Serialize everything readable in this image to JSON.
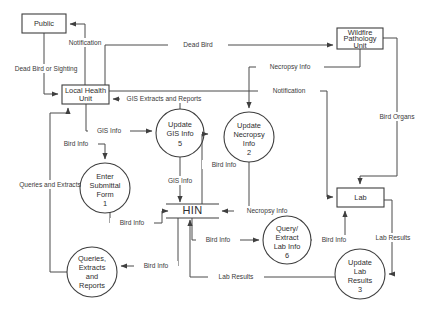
{
  "diagram": {
    "type": "data-flow-diagram",
    "colors": {
      "stroke": "#3f3f3f",
      "edge": "#4a4a4a",
      "text": "#2e2e2e",
      "background": "#ffffff"
    },
    "external_entities": [
      {
        "id": "public",
        "label": "Public",
        "x": 22,
        "y": 14,
        "w": 44,
        "h": 19
      },
      {
        "id": "local-health-unit",
        "label_line1": "Local Health",
        "label_line2": "Unit",
        "x": 62,
        "y": 85,
        "w": 47,
        "h": 19
      },
      {
        "id": "wildfire-pathology-unit",
        "label_line1": "Wildfire",
        "label_line2": "Pathology",
        "label_line3": "Unit",
        "x": 337,
        "y": 28,
        "w": 46,
        "h": 21
      },
      {
        "id": "lab",
        "label": "Lab",
        "x": 337,
        "y": 188,
        "w": 47,
        "h": 19
      }
    ],
    "processes": [
      {
        "id": "enter-submittal-form",
        "number": "1",
        "lines": [
          "Enter",
          "Submittal",
          "Form"
        ],
        "cx": 105,
        "cy": 188,
        "r": 25
      },
      {
        "id": "update-necropsy-info",
        "number": "2",
        "lines": [
          "Update",
          "Necropsy",
          "Info"
        ],
        "cx": 249,
        "cy": 137,
        "r": 25
      },
      {
        "id": "update-lab-results",
        "number": "3",
        "lines": [
          "Update",
          "Lab",
          "Results"
        ],
        "cx": 360,
        "cy": 274,
        "r": 25
      },
      {
        "id": "update-gis-info",
        "number": "5",
        "lines": [
          "Update",
          "GIS Info"
        ],
        "cx": 180,
        "cy": 133,
        "r": 24
      },
      {
        "id": "query-extract-lab-info",
        "number": "6",
        "lines": [
          "Query/",
          "Extract",
          "Lab Info"
        ],
        "cx": 287,
        "cy": 240,
        "r": 24
      },
      {
        "id": "queries-extracts-reports",
        "number": "",
        "lines": [
          "Queries,",
          "Extracts",
          "and",
          "Reports"
        ],
        "cx": 92,
        "cy": 272,
        "r": 25
      }
    ],
    "data_stores": [
      {
        "id": "hin",
        "label": "HIN",
        "x1": 166,
        "x2": 219,
        "cy": 211
      }
    ],
    "flows": [
      {
        "id": "dead-bird-or-sighting",
        "label": "Dead Bird or Sighting",
        "from": "public",
        "to": "local-health-unit"
      },
      {
        "id": "notification-to-public",
        "label": "Notification",
        "from": "local-health-unit",
        "to": "public"
      },
      {
        "id": "dead-bird",
        "label": "Dead Bird",
        "from": "local-health-unit",
        "to": "wildfire-pathology-unit"
      },
      {
        "id": "necropsy-info-top",
        "label": "Necropsy Info",
        "from": "wildfire-pathology-unit",
        "to": "update-necropsy-info"
      },
      {
        "id": "notification-to-lab",
        "label": "Notification",
        "from": "local-health-unit",
        "to": "lab"
      },
      {
        "id": "bird-organs",
        "label": "Bird Organs",
        "from": "wildfire-pathology-unit",
        "to": "lab"
      },
      {
        "id": "gis-extracts-and-reports",
        "label": "GIS Extracts and Reports",
        "from": "update-gis-info",
        "to": "local-health-unit"
      },
      {
        "id": "gis-info-in",
        "label": "GIS Info",
        "from": "local-health-unit",
        "to": "update-gis-info"
      },
      {
        "id": "bird-info-to-form",
        "label": "Bird Info",
        "from": "local-health-unit",
        "to": "enter-submittal-form"
      },
      {
        "id": "queries-and-extracts",
        "label": "Queries and Extracts",
        "from": "queries-extracts-reports",
        "to": "local-health-unit"
      },
      {
        "id": "gis-info-out",
        "label": "GIS Info",
        "from": "update-gis-info",
        "to": "hin"
      },
      {
        "id": "bird-info-hin-to-gis",
        "label": "Bird Info",
        "from": "hin",
        "to": "update-gis-info"
      },
      {
        "id": "bird-info-form-to-hin",
        "label": "Bird Info",
        "from": "enter-submittal-form",
        "to": "hin"
      },
      {
        "id": "necropsy-info-to-hin",
        "label": "Necropsy Info",
        "from": "update-necropsy-info",
        "to": "hin"
      },
      {
        "id": "bird-info-hin-to-query",
        "label": "Bird Info",
        "from": "hin",
        "to": "query-extract-lab-info"
      },
      {
        "id": "bird-info-query-to-lab",
        "label": "Bird Info",
        "from": "query-extract-lab-info",
        "to": "lab"
      },
      {
        "id": "lab-results-to-update",
        "label": "Lab Results",
        "from": "lab",
        "to": "update-lab-results"
      },
      {
        "id": "lab-results-to-hin",
        "label": "Lab Results",
        "from": "update-lab-results",
        "to": "hin"
      },
      {
        "id": "bird-info-hin-to-reports",
        "label": "Bird Info",
        "from": "hin",
        "to": "queries-extracts-reports"
      }
    ],
    "labels": {
      "public": "Public",
      "local_health_unit_1": "Local Health",
      "local_health_unit_2": "Unit",
      "wildfire_1": "Wildfire",
      "wildfire_2": "Pathology",
      "wildfire_3": "Unit",
      "lab": "Lab",
      "hin": "HIN",
      "p1_1": "Enter",
      "p1_2": "Submittal",
      "p1_3": "Form",
      "p1_n": "1",
      "p2_1": "Update",
      "p2_2": "Necropsy",
      "p2_3": "Info",
      "p2_n": "2",
      "p3_1": "Update",
      "p3_2": "Lab",
      "p3_3": "Results",
      "p3_n": "3",
      "p5_1": "Update",
      "p5_2": "GIS Info",
      "p5_n": "5",
      "p6_1": "Query/",
      "p6_2": "Extract",
      "p6_3": "Lab Info",
      "p6_n": "6",
      "pq_1": "Queries,",
      "pq_2": "Extracts",
      "pq_3": "and",
      "pq_4": "Reports",
      "f_dead_bird_or_sighting": "Dead Bird or Sighting",
      "f_notification_public": "Notification",
      "f_dead_bird": "Dead Bird",
      "f_necropsy_info_top": "Necropsy Info",
      "f_notification_lab": "Notification",
      "f_bird_organs": "Bird Organs",
      "f_gis_extracts_reports": "GIS Extracts and Reports",
      "f_gis_info_in": "GIS Info",
      "f_bird_info_form": "Bird Info",
      "f_queries_and_extracts": "Queries and Extracts",
      "f_gis_info_out": "GIS Info",
      "f_bird_info_gis": "Bird Info",
      "f_bird_info_hin": "Bird Info",
      "f_necropsy_info_hin": "Necropsy Info",
      "f_bird_info_query": "Bird Info",
      "f_bird_info_lab": "Bird Info",
      "f_lab_results_update": "Lab Results",
      "f_lab_results_hin": "Lab Results",
      "f_bird_info_reports": "Bird Info"
    }
  }
}
